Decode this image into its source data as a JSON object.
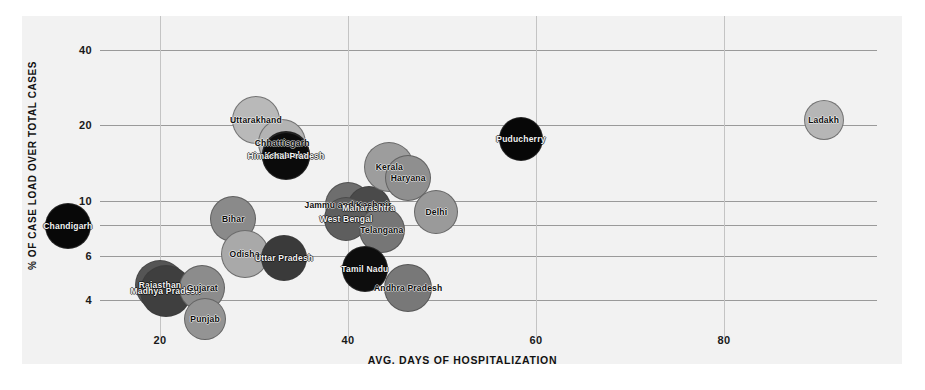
{
  "chart_data": {
    "type": "scatter",
    "title": "",
    "xlabel": "AVG. DAYS OF HOSPITALIZATION",
    "ylabel": "% OF CASE LOAD OVER TOTAL CASES",
    "xlim": [
      10,
      95
    ],
    "ylim": [
      3.2,
      48
    ],
    "yscale": "log",
    "xscale": "linear",
    "grid": "both",
    "legend": "none",
    "xticks": [
      20,
      40,
      60,
      80
    ],
    "yticks": [
      4,
      6,
      8,
      10,
      20,
      40
    ],
    "points": [
      {
        "label": "Chandigarh",
        "x": 10.2,
        "y": 7.9,
        "size": 46,
        "color": "#080808"
      },
      {
        "label": "Rajasthan",
        "x": 20.0,
        "y": 4.6,
        "size": 50,
        "color": "#555555"
      },
      {
        "label": "Madhya Pradesh",
        "x": 20.6,
        "y": 4.35,
        "size": 52,
        "color": "#3f3f3f"
      },
      {
        "label": "Gujarat",
        "x": 24.5,
        "y": 4.45,
        "size": 46,
        "color": "#8c8c8c"
      },
      {
        "label": "Punjab",
        "x": 24.8,
        "y": 3.35,
        "size": 42,
        "color": "#949494"
      },
      {
        "label": "Bihar",
        "x": 27.8,
        "y": 8.4,
        "size": 46,
        "color": "#8a8a8a"
      },
      {
        "label": "Odisha",
        "x": 29.0,
        "y": 6.1,
        "size": 48,
        "color": "#a9a9a9"
      },
      {
        "label": "Uttar Pradesh",
        "x": 33.2,
        "y": 5.9,
        "size": 46,
        "color": "#3a3a3a"
      },
      {
        "label": "Uttarakhand",
        "x": 30.2,
        "y": 21.0,
        "size": 48,
        "color": "#b9b9b9"
      },
      {
        "label": "Chhattisgarh",
        "x": 33.0,
        "y": 17.0,
        "size": 48,
        "color": "#b3b3b3"
      },
      {
        "label": "Karnataka",
        "x": 33.4,
        "y": 15.2,
        "size": 48,
        "color": "#0b0b0b"
      },
      {
        "label": "Himachal Pradesh",
        "x": 33.4,
        "y": 15.0,
        "size": 48,
        "color": "#0b0b0b"
      },
      {
        "label": "Jammu and Kashmir",
        "x": 40.0,
        "y": 9.6,
        "size": 46,
        "color": "#6e6e6e"
      },
      {
        "label": "Maharashtra",
        "x": 42.2,
        "y": 9.3,
        "size": 44,
        "color": "#4a4a4a"
      },
      {
        "label": "West Bengal",
        "x": 39.8,
        "y": 8.4,
        "size": 44,
        "color": "#5e5e5e"
      },
      {
        "label": "Telangana",
        "x": 43.6,
        "y": 7.6,
        "size": 46,
        "color": "#767676"
      },
      {
        "label": "Tamil Nadu",
        "x": 41.8,
        "y": 5.3,
        "size": 46,
        "color": "#0d0d0d"
      },
      {
        "label": "Andhra Pradesh",
        "x": 46.4,
        "y": 4.45,
        "size": 48,
        "color": "#787878"
      },
      {
        "label": "Kerala",
        "x": 44.4,
        "y": 13.6,
        "size": 50,
        "color": "#9d9d9d"
      },
      {
        "label": "Haryana",
        "x": 46.4,
        "y": 12.3,
        "size": 46,
        "color": "#8f8f8f"
      },
      {
        "label": "Delhi",
        "x": 49.4,
        "y": 9.0,
        "size": 44,
        "color": "#9a9a9a"
      },
      {
        "label": "Puducherry",
        "x": 58.4,
        "y": 17.6,
        "size": 44,
        "color": "#070707"
      },
      {
        "label": "Ladakh",
        "x": 90.6,
        "y": 21.0,
        "size": 40,
        "color": "#b6b6b6"
      }
    ]
  },
  "axes": {
    "x_title": "AVG. DAYS OF HOSPITALIZATION",
    "y_title": "% OF CASE LOAD OVER TOTAL CASES"
  }
}
